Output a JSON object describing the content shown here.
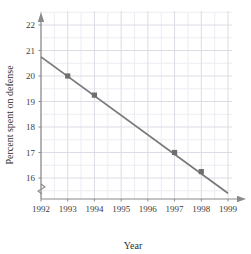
{
  "chart_data": {
    "type": "line",
    "title": "",
    "xlabel": "Year",
    "ylabel": "Percent spent on defense",
    "x": [
      1992,
      1993,
      1994,
      1995,
      1996,
      1997,
      1998,
      1999
    ],
    "xtick_labels": [
      "1992",
      "1993",
      "1994",
      "1995",
      "1996",
      "1997",
      "1998",
      "1999"
    ],
    "ytick_labels": [
      "16",
      "17",
      "18",
      "19",
      "20",
      "21",
      "22"
    ],
    "yticks": [
      16,
      17,
      18,
      19,
      20,
      21,
      22
    ],
    "xlim": [
      1992,
      1999
    ],
    "ylim": [
      15.3,
      22.4
    ],
    "y_axis_break": true,
    "grid": true,
    "grid_minor": true,
    "legend": "none",
    "series": [
      {
        "name": "Percent spent on defense",
        "color": "#7a7a7a",
        "marker": "square",
        "line_start": {
          "x": 1992,
          "y": 20.75
        },
        "line_end": {
          "x": 1999,
          "y": 15.4
        },
        "points": [
          {
            "x": 1993,
            "y": 20.0
          },
          {
            "x": 1994,
            "y": 19.25
          },
          {
            "x": 1997,
            "y": 17.0
          },
          {
            "x": 1998,
            "y": 16.25
          }
        ]
      }
    ]
  },
  "colors": {
    "line": "#7a7a7a",
    "marker": "#6e6e6e",
    "grid": "#dcdce6",
    "grid_minor": "#ececf3",
    "axis": "#8a8a8a",
    "text": "#3b3b3b"
  }
}
